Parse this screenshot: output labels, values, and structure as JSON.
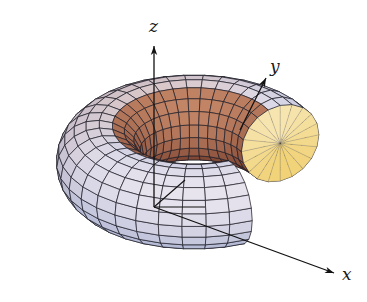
{
  "figure": {
    "surface": {
      "type": "partial-torus",
      "major_radius": 1.0,
      "minor_radius": 0.45,
      "theta_start_deg": -10,
      "theta_end_deg": 260,
      "theta_segments": 27,
      "phi_segments": 20,
      "mesh_color": "#1e1e28",
      "colors": {
        "outer_light": "#e8e4ee",
        "outer_blue": "#9aa4c8",
        "inner_dark": "#5a2418",
        "inner_warm": "#c88a6a",
        "cap_left": "#e8a85a",
        "cap_right": "#f0d070"
      }
    },
    "projection": {
      "origin_px": [
        154,
        207
      ],
      "scale": 95,
      "yaw_deg": 35,
      "pitch_deg": 28
    },
    "axes": {
      "color": "#111111",
      "z": {
        "label": "z",
        "from": [
          154,
          207
        ],
        "to": [
          154,
          46
        ],
        "label_pos": [
          149,
          32
        ]
      },
      "y": {
        "label": "y",
        "from": [
          240,
          130
        ],
        "to": [
          266,
          78
        ],
        "label_pos": [
          270,
          72
        ]
      },
      "x": {
        "label": "x",
        "from": [
          154,
          207
        ],
        "to": [
          334,
          273
        ],
        "label_pos": [
          342,
          280
        ]
      },
      "hidden_y": {
        "from": [
          154,
          207
        ],
        "to": [
          185,
          180
        ]
      },
      "base_line": {
        "from": [
          154,
          207
        ],
        "to": [
          205,
          207
        ]
      }
    }
  }
}
